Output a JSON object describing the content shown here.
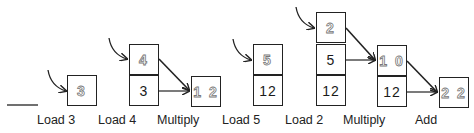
{
  "diagram": {
    "type": "stack-machine-trace",
    "steps": [
      {
        "label": "Load 3",
        "stack": [
          "3"
        ],
        "new_top": "3"
      },
      {
        "label": "Load 4",
        "stack": [
          "4",
          "3"
        ],
        "new_top": "4"
      },
      {
        "label": "Multiply",
        "stack": [
          "1 2"
        ],
        "new_top": "1 2"
      },
      {
        "label": "Load 5",
        "stack": [
          "5",
          "12"
        ],
        "new_top": "5"
      },
      {
        "label": "Load 2",
        "stack": [
          "2",
          "5",
          "12"
        ],
        "new_top": "2"
      },
      {
        "label": "Multiply",
        "stack": [
          "1 0",
          "12"
        ],
        "new_top": "1 0"
      },
      {
        "label": "Add",
        "stack": [
          "2 2"
        ],
        "new_top": "2 2"
      }
    ],
    "colors": {
      "stroke": "#222222",
      "hollow_text_outline": "#777777"
    }
  }
}
